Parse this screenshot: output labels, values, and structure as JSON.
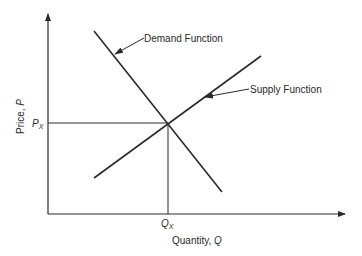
{
  "diagram": {
    "title": "",
    "axes": {
      "y_label_text": "Price, ",
      "y_label_var": "P",
      "x_label_text": "Quantity, ",
      "x_label_var": "Q"
    },
    "equilibrium": {
      "price_label": "P",
      "price_sub": "X",
      "quantity_label": "Q",
      "quantity_sub": "X"
    },
    "curves": [
      {
        "name": "Demand Function",
        "slope": "negative"
      },
      {
        "name": "Supply Function",
        "slope": "positive"
      }
    ],
    "colors": {
      "line": "#2a2a2a",
      "background": "#ffffff"
    }
  }
}
